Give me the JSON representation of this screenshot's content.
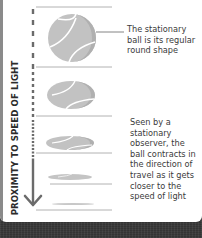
{
  "axis": {
    "label": "PROXIMITY TO SPEED OF LIGHT",
    "arrow_direction": "down"
  },
  "captions": {
    "stationary": "The stationary ball is its regular round shape",
    "moving": "Seen by a stationary observer, the ball contracts in the direction of travel as it gets closer to the speed of light"
  },
  "colors": {
    "ball_fill": "#bdbdbd",
    "ball_shadow": "#a9a9a9",
    "seam": "#ffffff",
    "line": "#9a9a9a",
    "arrow": "#6b6b6b",
    "text": "#3b3b3b",
    "background": "#383838"
  },
  "balls": [
    {
      "name": "stationary",
      "rx": 24,
      "ry": 24
    },
    {
      "name": "slow",
      "rx": 24,
      "ry": 14
    },
    {
      "name": "faster",
      "rx": 24,
      "ry": 7
    },
    {
      "name": "fastest",
      "rx": 22,
      "ry": 3
    },
    {
      "name": "near-light",
      "rx": 22,
      "ry": 1
    }
  ]
}
